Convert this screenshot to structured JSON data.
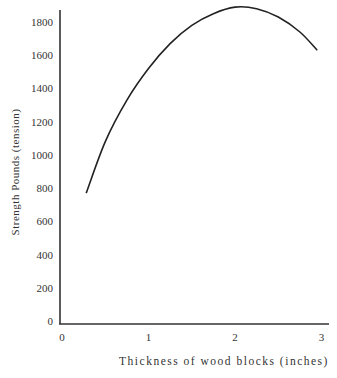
{
  "chart_data": {
    "type": "line",
    "title": "",
    "xlabel": "Thickness of wood blocks (inches)",
    "ylabel": "Strength Pounds (tension)",
    "xlim": [
      0,
      3
    ],
    "ylim": [
      0,
      1800
    ],
    "xticks": [
      0,
      1,
      2,
      3
    ],
    "yticks": [
      0,
      200,
      400,
      600,
      800,
      1000,
      1200,
      1400,
      1600,
      1800
    ],
    "grid": false,
    "legend": null,
    "series": [
      {
        "name": "Strength",
        "x": [
          0.28,
          0.5,
          0.75,
          1.0,
          1.25,
          1.5,
          1.75,
          2.0,
          2.25,
          2.5,
          2.75,
          2.95
        ],
        "values": [
          770,
          1080,
          1330,
          1520,
          1670,
          1780,
          1850,
          1890,
          1880,
          1830,
          1740,
          1630
        ]
      }
    ]
  }
}
